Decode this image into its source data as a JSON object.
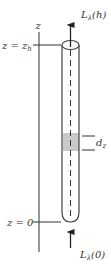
{
  "diagram": {
    "type": "column-radiance-schematic",
    "axis": {
      "label": "z",
      "ticks": [
        {
          "id": "top",
          "label_main": "z = z",
          "label_sub": "h"
        },
        {
          "id": "bottom",
          "label_main": "z = 0",
          "label_sub": ""
        }
      ]
    },
    "top_arrow": {
      "label_main": "L",
      "label_sub": "λ",
      "label_arg": "(h)"
    },
    "bottom_arrow": {
      "label_main": "L",
      "label_sub": "λ",
      "label_arg": "(0)"
    },
    "element": {
      "label_main": "d",
      "label_sub": "z"
    },
    "colors": {
      "line": "#333333",
      "cylinder_edge": "#444444",
      "slab_fill": "#c8c8c8",
      "background": "#ffffff"
    }
  }
}
